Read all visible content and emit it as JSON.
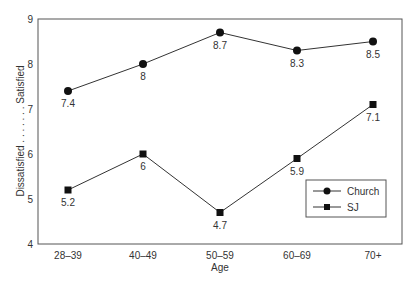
{
  "chart_data": {
    "type": "line",
    "title": "",
    "xlabel": "Age",
    "ylabel": "Dissatisfied . . . . . . . Satisfied",
    "ylabel_parts": [
      "Dissatisfied",
      ". . . . . . .",
      "Satisfied"
    ],
    "categories": [
      "28–39",
      "40–49",
      "50–59",
      "60–69",
      "70+"
    ],
    "ylim": [
      4,
      9
    ],
    "yticks": [
      4,
      5,
      6,
      7,
      8,
      9
    ],
    "grid": false,
    "legend_position": "lower right",
    "series": [
      {
        "name": "Church",
        "marker": "circle",
        "values": [
          7.4,
          8,
          8.7,
          8.3,
          8.5
        ],
        "labels": [
          "7.4",
          "8",
          "8.7",
          "8.3",
          "8.5"
        ]
      },
      {
        "name": "SJ",
        "marker": "square",
        "values": [
          5.2,
          6,
          4.7,
          5.9,
          7.1
        ],
        "labels": [
          "5.2",
          "6",
          "4.7",
          "5.9",
          "7.1"
        ]
      }
    ]
  },
  "colors": {
    "line": "#333333",
    "marker": "#111111",
    "frame": "#555555"
  }
}
